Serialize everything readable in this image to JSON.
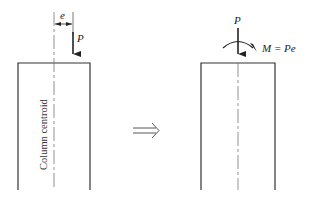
{
  "diagram": {
    "left": {
      "load_label": "P",
      "eccentricity_label": "e",
      "centroid_label": "Column centroid"
    },
    "transform_arrow": "implies-arrow",
    "right": {
      "load_label": "P",
      "moment_label": "M = Pe"
    },
    "colors": {
      "stroke": "#333333",
      "centroid_line": "#777777"
    }
  }
}
